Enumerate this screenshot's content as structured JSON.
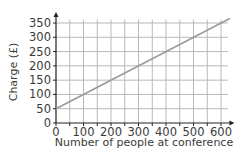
{
  "chart_data": {
    "type": "line",
    "title": "",
    "xlabel": "Number of people at conference",
    "ylabel": "Charge (£)",
    "xlim": [
      0,
      620
    ],
    "ylim": [
      0,
      360
    ],
    "grid": true,
    "x_ticks": [
      0,
      100,
      200,
      300,
      400,
      500,
      600
    ],
    "y_ticks": [
      0,
      50,
      100,
      150,
      200,
      250,
      300,
      350
    ],
    "series": [
      {
        "name": "Charge",
        "x": [
          0,
          100,
          200,
          300,
          400,
          500,
          600
        ],
        "y": [
          50,
          100,
          150,
          200,
          250,
          300,
          350
        ],
        "color": "#9a9a9a"
      }
    ],
    "legend": null
  },
  "axes": {
    "x_tick_labels": [
      "0",
      "100",
      "200",
      "300",
      "400",
      "500",
      "600"
    ],
    "y_tick_labels": [
      "0",
      "50",
      "100",
      "150",
      "200",
      "250",
      "300",
      "350"
    ],
    "xlabel": "Number of people at conference",
    "ylabel": "Charge (£)"
  },
  "colors": {
    "grid": "#b8b8b8",
    "axis": "#222222",
    "line": "#9a9a9a",
    "text": "#3a3a3a"
  }
}
